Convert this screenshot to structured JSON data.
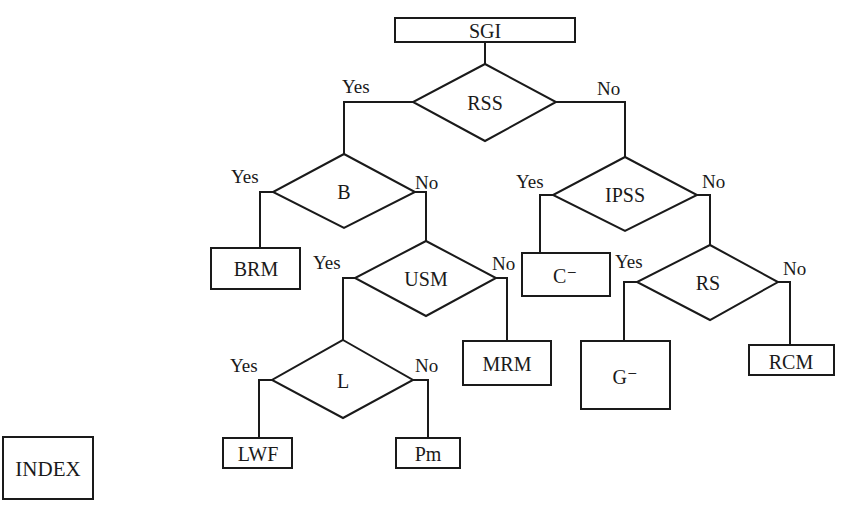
{
  "title_node": "SGI",
  "index_label": "INDEX",
  "decisions": {
    "rss": "RSS",
    "b": "B",
    "usm": "USM",
    "l": "L",
    "ipss": "IPSS",
    "rs": "RS"
  },
  "outcomes": {
    "brm": "BRM",
    "mrm": "MRM",
    "lwf": "LWF",
    "pm": "Pm",
    "c_minus": "C⁻",
    "g_minus": "G⁻",
    "rcm": "RCM"
  },
  "branch_labels": {
    "yes": "Yes",
    "no": "No"
  },
  "colors": {
    "line": "#1a1a1a",
    "background": "#ffffff"
  }
}
